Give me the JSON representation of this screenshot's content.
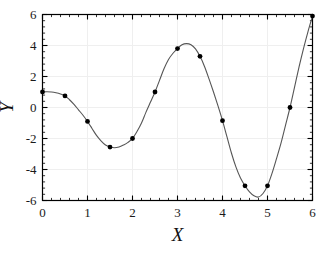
{
  "chart_data": {
    "type": "line",
    "title": "",
    "subtitle": "",
    "xlabel": "X",
    "ylabel": "Y",
    "xlim": [
      0,
      6
    ],
    "ylim": [
      -6,
      6
    ],
    "xticks": [
      0,
      1,
      2,
      3,
      4,
      5,
      6
    ],
    "yticks": [
      -6,
      -4,
      -2,
      0,
      2,
      4,
      6
    ],
    "xtick_labels": [
      "0",
      "1",
      "2",
      "3",
      "4",
      "5",
      "6"
    ],
    "ytick_labels": [
      "-6",
      "-4",
      "-2",
      "0",
      "2",
      "4",
      "6"
    ],
    "x_minor_per_major": 5,
    "y_minor_per_major": 5,
    "grid": true,
    "grid_color": "#efefef",
    "legend": null,
    "legend_position": "none",
    "frame_color": "#000000",
    "line_color": "#555555",
    "marker_color": "#000000",
    "marker_shape": "circle",
    "marker_size": 4,
    "background": "#ffffff",
    "series": [
      {
        "name": "data points",
        "marker": true,
        "x": [
          0,
          0.5,
          1,
          1.5,
          2,
          2.5,
          3,
          3.5,
          4,
          4.5,
          5,
          5.5,
          6
        ],
        "values": [
          1.0,
          0.75,
          -0.9,
          -2.55,
          -2.0,
          1.0,
          3.8,
          3.3,
          -0.85,
          -5.05,
          -5.05,
          0.0,
          5.9
        ]
      },
      {
        "name": "interpolated curve",
        "marker": false,
        "x": [
          0,
          0.1,
          0.2,
          0.3,
          0.4,
          0.5,
          0.6,
          0.7,
          0.8,
          0.9,
          1.0,
          1.1,
          1.2,
          1.3,
          1.4,
          1.5,
          1.6,
          1.7,
          1.8,
          1.9,
          2.0,
          2.1,
          2.2,
          2.3,
          2.4,
          2.5,
          2.6,
          2.7,
          2.8,
          2.9,
          3.0,
          3.1,
          3.2,
          3.3,
          3.4,
          3.5,
          3.6,
          3.7,
          3.8,
          3.9,
          4.0,
          4.1,
          4.2,
          4.3,
          4.4,
          4.5,
          4.6,
          4.7,
          4.8,
          4.9,
          5.0,
          5.1,
          5.2,
          5.3,
          5.4,
          5.5,
          5.6,
          5.7,
          5.8,
          5.9,
          6.0
        ],
        "values": [
          1.0,
          1.02,
          1.0,
          0.95,
          0.87,
          0.75,
          0.5,
          0.2,
          -0.15,
          -0.5,
          -0.9,
          -1.35,
          -1.8,
          -2.15,
          -2.42,
          -2.55,
          -2.6,
          -2.55,
          -2.42,
          -2.25,
          -2.0,
          -1.55,
          -1.0,
          -0.3,
          0.35,
          1.0,
          1.75,
          2.5,
          3.1,
          3.5,
          3.8,
          4.05,
          4.12,
          4.05,
          3.78,
          3.3,
          2.65,
          1.85,
          1.0,
          0.1,
          -0.85,
          -1.9,
          -2.95,
          -3.85,
          -4.55,
          -5.05,
          -5.45,
          -5.7,
          -5.78,
          -5.55,
          -5.05,
          -4.25,
          -3.3,
          -2.3,
          -1.15,
          0.0,
          1.3,
          2.6,
          3.8,
          4.9,
          5.9
        ]
      }
    ]
  }
}
